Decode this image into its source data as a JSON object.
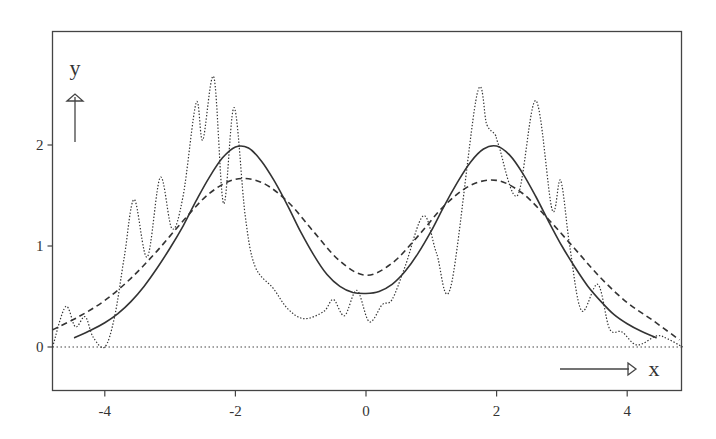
{
  "chart_data": {
    "type": "line",
    "title": "",
    "xlabel": "x",
    "ylabel": "y",
    "xlim": [
      -4.8,
      4.85
    ],
    "ylim": [
      -0.42,
      3.1
    ],
    "grid": false,
    "legend": null,
    "x_ticks": [
      -4,
      -2,
      0,
      2,
      4
    ],
    "x_tick_labels": [
      "-4",
      "-2",
      "0",
      "2",
      "4"
    ],
    "y_ticks": [
      0,
      1,
      2
    ],
    "y_tick_labels": [
      "0",
      "1",
      "2"
    ],
    "reference_lines": [
      {
        "axis": "y",
        "value": 0,
        "style": "dotted"
      }
    ],
    "series": [
      {
        "name": "solid",
        "style": "solid",
        "x": [
          -4.47,
          -4.2,
          -4.0,
          -3.8,
          -3.6,
          -3.4,
          -3.2,
          -3.0,
          -2.8,
          -2.6,
          -2.4,
          -2.2,
          -2.0,
          -1.8,
          -1.6,
          -1.4,
          -1.2,
          -1.0,
          -0.8,
          -0.6,
          -0.4,
          -0.2,
          0.0,
          0.2,
          0.4,
          0.6,
          0.8,
          1.0,
          1.2,
          1.4,
          1.6,
          1.8,
          2.0,
          2.2,
          2.4,
          2.6,
          2.8,
          3.0,
          3.2,
          3.4,
          3.6,
          3.8,
          4.0,
          4.2,
          4.45
        ],
        "y": [
          0.09,
          0.17,
          0.24,
          0.33,
          0.45,
          0.6,
          0.78,
          0.98,
          1.2,
          1.45,
          1.68,
          1.87,
          1.98,
          1.97,
          1.84,
          1.64,
          1.4,
          1.14,
          0.91,
          0.72,
          0.6,
          0.54,
          0.53,
          0.55,
          0.62,
          0.75,
          0.93,
          1.15,
          1.4,
          1.63,
          1.83,
          1.96,
          1.99,
          1.9,
          1.72,
          1.49,
          1.24,
          1.0,
          0.79,
          0.6,
          0.45,
          0.32,
          0.23,
          0.16,
          0.09
        ]
      },
      {
        "name": "dashed",
        "style": "dashed",
        "x": [
          -4.8,
          -4.4,
          -4.0,
          -3.6,
          -3.2,
          -2.8,
          -2.4,
          -2.0,
          -1.6,
          -1.2,
          -0.8,
          -0.4,
          0.0,
          0.4,
          0.8,
          1.2,
          1.6,
          2.0,
          2.4,
          2.8,
          3.2,
          3.6,
          4.0,
          4.4,
          4.8
        ],
        "y": [
          0.17,
          0.3,
          0.46,
          0.68,
          0.95,
          1.25,
          1.52,
          1.66,
          1.63,
          1.44,
          1.14,
          0.85,
          0.71,
          0.83,
          1.1,
          1.4,
          1.6,
          1.65,
          1.52,
          1.26,
          0.97,
          0.68,
          0.44,
          0.26,
          0.07
        ]
      },
      {
        "name": "dotted",
        "style": "dotted",
        "x": [
          -4.8,
          -4.6,
          -4.45,
          -4.3,
          -4.18,
          -4.0,
          -3.85,
          -3.7,
          -3.55,
          -3.35,
          -3.15,
          -2.97,
          -2.8,
          -2.6,
          -2.5,
          -2.33,
          -2.18,
          -2.02,
          -1.85,
          -1.7,
          -1.42,
          -1.2,
          -0.95,
          -0.65,
          -0.5,
          -0.33,
          -0.14,
          0.05,
          0.25,
          0.4,
          0.6,
          0.88,
          1.08,
          1.3,
          1.7,
          1.85,
          1.98,
          2.03,
          2.32,
          2.6,
          2.85,
          2.98,
          3.12,
          3.3,
          3.55,
          3.73,
          3.92,
          4.15,
          4.45,
          4.62,
          4.85
        ],
        "y": [
          0.0,
          0.4,
          0.2,
          0.3,
          0.1,
          0.0,
          0.3,
          0.9,
          1.46,
          0.89,
          1.68,
          1.17,
          1.5,
          2.42,
          2.05,
          2.67,
          1.42,
          2.37,
          1.3,
          0.8,
          0.58,
          0.38,
          0.28,
          0.35,
          0.47,
          0.31,
          0.56,
          0.25,
          0.42,
          0.47,
          0.8,
          1.3,
          0.93,
          0.6,
          2.5,
          2.2,
          2.1,
          2.0,
          1.5,
          2.44,
          1.36,
          1.65,
          1.0,
          0.36,
          0.62,
          0.18,
          0.15,
          0.02,
          0.11,
          0.08,
          0.0
        ]
      }
    ],
    "annotations": [
      {
        "text": "y",
        "kind": "axis-arrow",
        "direction": "up"
      },
      {
        "text": "x",
        "kind": "axis-arrow",
        "direction": "right"
      }
    ]
  },
  "labels": {
    "x_axis_name": "x",
    "y_axis_name": "y"
  }
}
